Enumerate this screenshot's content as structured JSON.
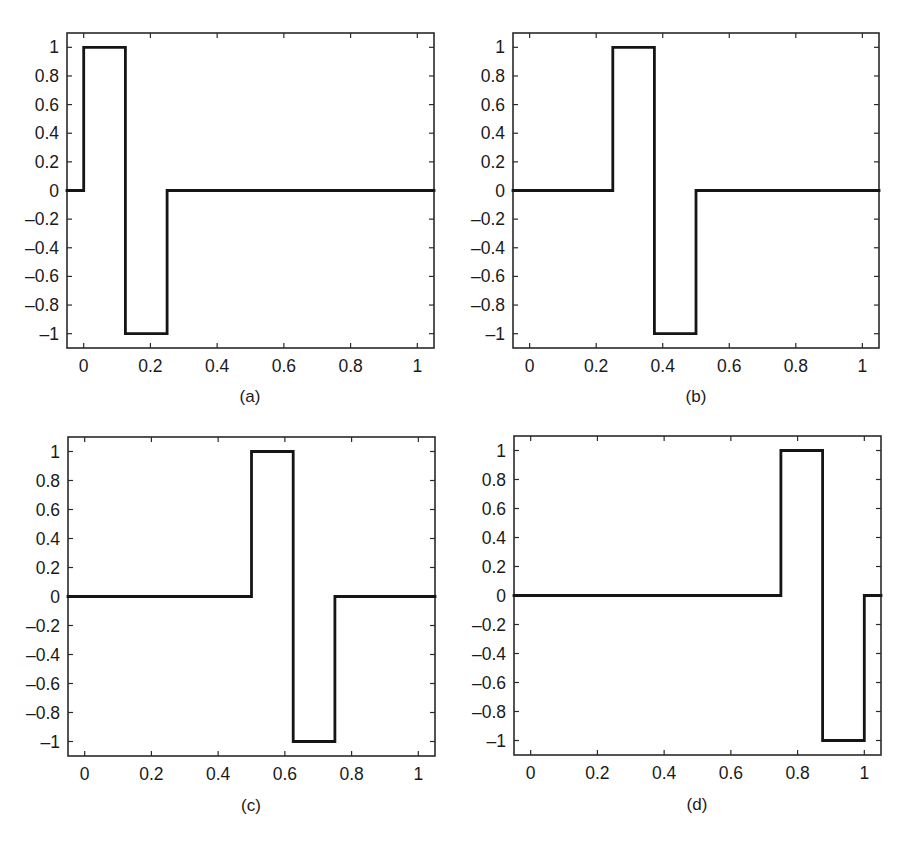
{
  "figure": {
    "panels": [
      {
        "label": "(a)",
        "box": {
          "x0": 67,
          "y0": 33,
          "x1": 434,
          "y1": 348
        },
        "caption_pos": {
          "x": 250,
          "y": 402
        }
      },
      {
        "label": "(b)",
        "box": {
          "x0": 513,
          "y0": 33,
          "x1": 879,
          "y1": 348
        },
        "caption_pos": {
          "x": 696,
          "y": 402
        }
      },
      {
        "label": "(c)",
        "box": {
          "x0": 68,
          "y0": 437,
          "x1": 435,
          "y1": 756
        },
        "caption_pos": {
          "x": 251,
          "y": 811
        }
      },
      {
        "label": "(d)",
        "box": {
          "x0": 514,
          "y0": 436,
          "x1": 881,
          "y1": 755
        },
        "caption_pos": {
          "x": 697,
          "y": 810
        }
      }
    ]
  },
  "chart_data": [
    {
      "type": "line",
      "title": "(a)",
      "xlabel": "",
      "ylabel": "",
      "xlim": [
        -0.05,
        1.05
      ],
      "ylim": [
        -1.1,
        1.1
      ],
      "xticks": [
        0,
        0.2,
        0.4,
        0.6,
        0.8,
        1
      ],
      "xtick_labels": [
        "0",
        "0.2",
        "0.4",
        "0.6",
        "0.8",
        "1"
      ],
      "yticks": [
        1,
        0.8,
        0.6,
        0.4,
        0.2,
        0,
        -0.2,
        -0.4,
        -0.6,
        -0.8,
        -1
      ],
      "ytick_labels": [
        "1",
        "0.8",
        "0.6",
        "0.4",
        "0.2",
        "0",
        "–0.2",
        "–0.4",
        "–0.6",
        "–0.8",
        "–1"
      ],
      "grid": false,
      "x": [
        -0.05,
        0,
        0,
        0.125,
        0.125,
        0.25,
        0.25,
        1.05
      ],
      "y": [
        0,
        0,
        1,
        1,
        -1,
        -1,
        0,
        0
      ]
    },
    {
      "type": "line",
      "title": "(b)",
      "xlabel": "",
      "ylabel": "",
      "xlim": [
        -0.05,
        1.05
      ],
      "ylim": [
        -1.1,
        1.1
      ],
      "xticks": [
        0,
        0.2,
        0.4,
        0.6,
        0.8,
        1
      ],
      "xtick_labels": [
        "0",
        "0.2",
        "0.4",
        "0.6",
        "0.8",
        "1"
      ],
      "yticks": [
        1,
        0.8,
        0.6,
        0.4,
        0.2,
        0,
        -0.2,
        -0.4,
        -0.6,
        -0.8,
        -1
      ],
      "ytick_labels": [
        "1",
        "0.8",
        "0.6",
        "0.4",
        "0.2",
        "0",
        "–0.2",
        "–0.4",
        "–0.6",
        "–0.8",
        "–1"
      ],
      "grid": false,
      "x": [
        -0.05,
        0.25,
        0.25,
        0.375,
        0.375,
        0.5,
        0.5,
        1.05
      ],
      "y": [
        0,
        0,
        1,
        1,
        -1,
        -1,
        0,
        0
      ]
    },
    {
      "type": "line",
      "title": "(c)",
      "xlabel": "",
      "ylabel": "",
      "xlim": [
        -0.05,
        1.05
      ],
      "ylim": [
        -1.1,
        1.1
      ],
      "xticks": [
        0,
        0.2,
        0.4,
        0.6,
        0.8,
        1
      ],
      "xtick_labels": [
        "0",
        "0.2",
        "0.4",
        "0.6",
        "0.8",
        "1"
      ],
      "yticks": [
        1,
        0.8,
        0.6,
        0.4,
        0.2,
        0,
        -0.2,
        -0.4,
        -0.6,
        -0.8,
        -1
      ],
      "ytick_labels": [
        "1",
        "0.8",
        "0.6",
        "0.4",
        "0.2",
        "0",
        "–0.2",
        "–0.4",
        "–0.6",
        "–0.8",
        "–1"
      ],
      "grid": false,
      "x": [
        -0.05,
        0.5,
        0.5,
        0.625,
        0.625,
        0.75,
        0.75,
        1.05
      ],
      "y": [
        0,
        0,
        1,
        1,
        -1,
        -1,
        0,
        0
      ]
    },
    {
      "type": "line",
      "title": "(d)",
      "xlabel": "",
      "ylabel": "",
      "xlim": [
        -0.05,
        1.05
      ],
      "ylim": [
        -1.1,
        1.1
      ],
      "xticks": [
        0,
        0.2,
        0.4,
        0.6,
        0.8,
        1
      ],
      "xtick_labels": [
        "0",
        "0.2",
        "0.4",
        "0.6",
        "0.8",
        "1"
      ],
      "yticks": [
        1,
        0.8,
        0.6,
        0.4,
        0.2,
        0,
        -0.2,
        -0.4,
        -0.6,
        -0.8,
        -1
      ],
      "ytick_labels": [
        "1",
        "0.8",
        "0.6",
        "0.4",
        "0.2",
        "0",
        "–0.2",
        "–0.4",
        "–0.6",
        "–0.8",
        "–1"
      ],
      "grid": false,
      "x": [
        -0.05,
        0.75,
        0.75,
        0.875,
        0.875,
        1,
        1,
        1.05
      ],
      "y": [
        0,
        0,
        1,
        1,
        -1,
        -1,
        0,
        0
      ]
    }
  ]
}
